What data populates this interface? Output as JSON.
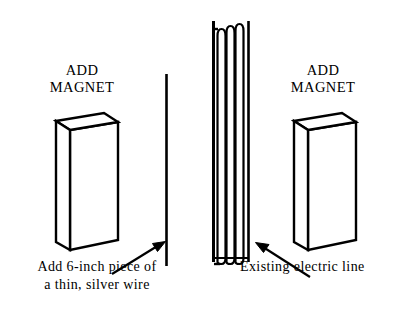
{
  "diagram": {
    "background_color": "#ffffff",
    "stroke_color": "#000000",
    "width": 415,
    "height": 323,
    "left_panel": {
      "magnet_label_line1": "ADD",
      "magnet_label_line2": "MAGNET",
      "magnet_shape": "rectangular-prism",
      "wire_description": "thin vertical silver wire",
      "caption_line1": "Add 6-inch piece of",
      "caption_line2": "a thin, silver wire",
      "arrow_direction": "up-right",
      "arrow_target": "silver-wire"
    },
    "right_panel": {
      "magnet_label_line1": "ADD",
      "magnet_label_line2": "MAGNET",
      "magnet_shape": "rectangular-prism",
      "coil_description": "coiled electric line",
      "coil_turns": 5,
      "caption_line1": "Existing electric line",
      "arrow_direction": "up-left",
      "arrow_target": "electric-line-coil"
    }
  }
}
